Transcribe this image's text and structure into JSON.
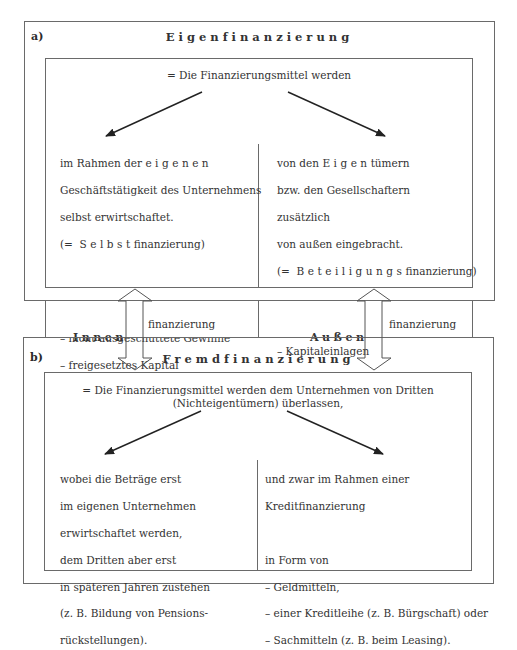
{
  "section_a": {
    "label": "a)",
    "title": "Eigenfinanzierung",
    "intro": "= Die Finanzierungsmittel werden",
    "left": {
      "l1_prefix": "im Rahmen der ",
      "l1_spaced": "eigenen",
      "l2": "Geschäftstätigkeit des Unternehmens",
      "l3": "selbst erwirtschaftet.",
      "l4_prefix": "(= ",
      "l4_spaced": "Selbst",
      "l4_suffix": "finanzierung)",
      "examples_heading": "Beispiele:",
      "examples": [
        "– nicht ausgeschüttete Gewinne",
        "– freigesetztes Kapital",
        "   aus Abschreibungen"
      ]
    },
    "right": {
      "l1_prefix": "von den ",
      "l1_spaced": "Eigen",
      "l1_suffix": "tümern",
      "l2": "bzw. den Gesellschaftern",
      "l3": "zusätzlich",
      "l4": "von außen eingebracht.",
      "l5_prefix": "(= ",
      "l5_spaced": "Beteiligungs",
      "l5_suffix": "finanzierung)",
      "examples_heading": "Beispiele:",
      "examples": [
        "– Kapitaleinlagen",
        "– Ausgabe neuer Aktien"
      ]
    }
  },
  "middle_band": {
    "left_spaced": "Innen",
    "left_suffix": "finanzierung",
    "right_spaced": "Außen",
    "right_suffix": "finanzierung"
  },
  "section_b": {
    "label": "b)",
    "title": "Fremdfinanzierung",
    "intro_line1": "= Die Finanzierungsmittel werden dem Unternehmen von Dritten",
    "intro_line2": "(Nichteigentümern) überlassen,",
    "left_lines": [
      "wobei die Beträge erst",
      "im eigenen Unternehmen",
      "erwirtschaftet werden,",
      "dem Dritten aber erst",
      "in späteren Jahren zustehen",
      "(z. B. Bildung von Pensions-",
      "rückstellungen)."
    ],
    "right_lines": [
      "und zwar im Rahmen einer",
      "Kreditfinanzierung",
      "",
      "in Form von",
      "– Geldmitteln,",
      "– einer Kreditleihe (z. B. Bürgschaft) oder",
      "– Sachmitteln (z. B. beim Leasing)."
    ]
  }
}
